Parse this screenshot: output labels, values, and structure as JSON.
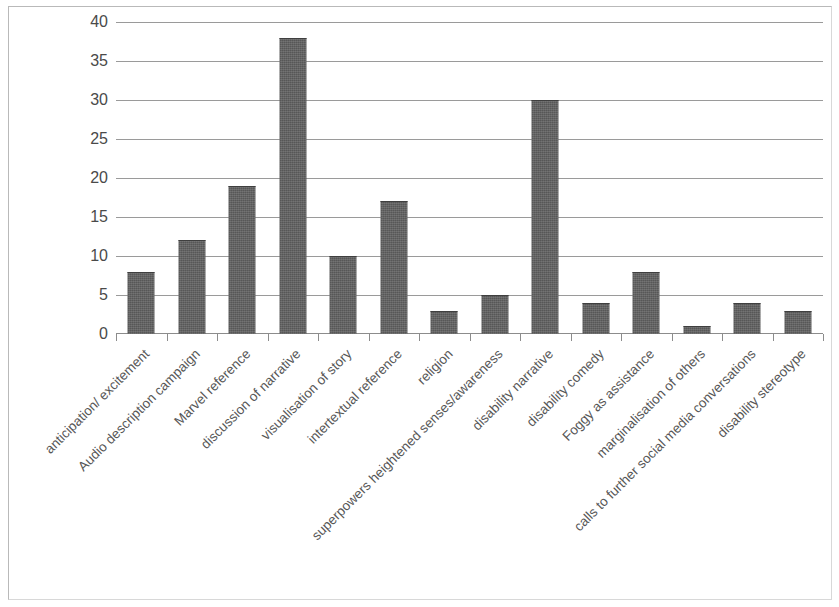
{
  "chart_data": {
    "type": "bar",
    "title": "",
    "subtitle": "",
    "xlabel": "",
    "ylabel": "",
    "ylim": [
      0,
      40
    ],
    "ytick_step": 5,
    "ytick_labels": [
      "40",
      "35",
      "30",
      "25",
      "20",
      "15",
      "10",
      "5",
      "0"
    ],
    "grid": true,
    "legend": false,
    "legend_position": "none",
    "bar_color": "#575757",
    "gridline_color": "#9a9a9a",
    "axis_color": "#8c8c8c",
    "categories": [
      "anticipation/ excitement",
      "Audio description campaign",
      "Marvel reference",
      "discussion of narrative",
      "visualisation of story",
      "intertextual reference",
      "religion",
      "superpowers heightened senses/awareness",
      "disability narrative",
      "disability comedy",
      "Foggy as assistance",
      "marginalisation of others",
      "calls to further social media conversations",
      "disability stereotype"
    ],
    "values": [
      8,
      12,
      19,
      38,
      10,
      17,
      3,
      5,
      30,
      4,
      8,
      1,
      4,
      3
    ]
  }
}
